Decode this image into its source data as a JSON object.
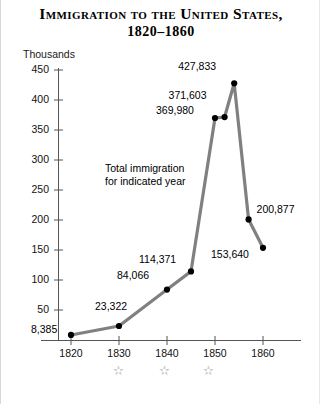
{
  "title": {
    "line1": "Immigration to the United States,",
    "line2": "1820–1860"
  },
  "axis": {
    "y_unit_label": "Thousands"
  },
  "annotation": {
    "line1": "Total immigration",
    "line2": "for indicated year"
  },
  "decorations": {
    "star_glyph": "✫",
    "star_color": "#c9c9c9",
    "count": 3
  },
  "colors": {
    "line": "#808080",
    "marker": "#000000",
    "axis": "#555555",
    "text": "#000000",
    "background": "#ffffff"
  },
  "chart_data": {
    "type": "line",
    "title": "Immigration to the United States, 1820–1860",
    "xlabel": "",
    "ylabel": "Thousands",
    "ylim": [
      0,
      450
    ],
    "xlim": [
      1815,
      1865
    ],
    "grid": false,
    "legend": null,
    "y_ticks": [
      50,
      100,
      150,
      200,
      250,
      300,
      350,
      400,
      450
    ],
    "x_ticks": [
      1820,
      1830,
      1840,
      1850,
      1860
    ],
    "x_tick_labels": [
      "1820",
      "1830",
      "1840",
      "1850",
      "1860"
    ],
    "annotation_text": "Total immigration for indicated year",
    "series": [
      {
        "name": "Total immigration",
        "points": [
          {
            "x": 1820,
            "y": 8.385,
            "label": "8,385"
          },
          {
            "x": 1830,
            "y": 23.322,
            "label": "23,322"
          },
          {
            "x": 1840,
            "y": 84.066,
            "label": "84,066"
          },
          {
            "x": 1845,
            "y": 114.371,
            "label": "114,371"
          },
          {
            "x": 1850,
            "y": 369.98,
            "label": "369,980"
          },
          {
            "x": 1852,
            "y": 371.603,
            "label": "371,603"
          },
          {
            "x": 1854,
            "y": 427.833,
            "label": "427,833"
          },
          {
            "x": 1857,
            "y": 200.877,
            "label": "200,877"
          },
          {
            "x": 1860,
            "y": 153.64,
            "label": "153,640"
          }
        ]
      }
    ]
  }
}
